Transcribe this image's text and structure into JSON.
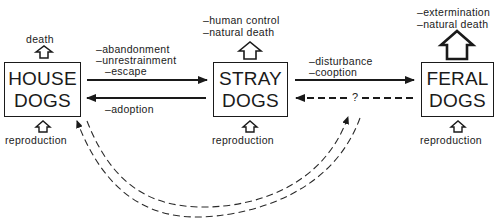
{
  "diagram": {
    "nodes": [
      {
        "id": "house",
        "line1": "HOUSE",
        "line2": "DOGS"
      },
      {
        "id": "stray",
        "line1": "STRAY",
        "line2": "DOGS"
      },
      {
        "id": "feral",
        "line1": "FERAL",
        "line2": "DOGS"
      }
    ],
    "outflows": {
      "house": [
        "death"
      ],
      "stray": [
        "–human control",
        "–natural death"
      ],
      "feral": [
        "–extermination",
        "–natural death"
      ]
    },
    "inflows": {
      "house": "reproduction",
      "stray": "reproduction",
      "feral": "reproduction"
    },
    "edges": {
      "house_to_stray": [
        "–abandonment",
        "–unrestrainment",
        "–escape"
      ],
      "stray_to_house": [
        "–adoption"
      ],
      "stray_to_feral": [
        "–disturbance",
        "–cooption"
      ],
      "feral_to_stray": "?"
    }
  }
}
